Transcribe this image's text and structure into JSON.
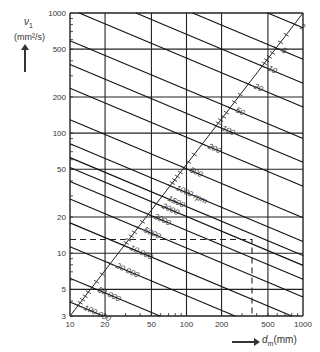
{
  "chart_data": {
    "type": "line",
    "title": "",
    "ylabel": "ν1 (mm²/s)",
    "xlabel": "dm (mm)",
    "xscale": "log",
    "yscale": "log",
    "xlim": [
      10,
      1000
    ],
    "ylim": [
      3,
      1000
    ],
    "grid": true,
    "x_ticks": [
      10,
      20,
      50,
      100,
      200,
      500,
      1000
    ],
    "x_tick_labels": [
      "10",
      "20",
      "50",
      "100",
      "200",
      "500",
      "1000"
    ],
    "y_ticks": [
      3,
      5,
      10,
      20,
      50,
      100,
      200,
      500,
      1000
    ],
    "y_tick_labels": [
      "3",
      "5",
      "10",
      "20",
      "50",
      "100",
      "200",
      "500",
      "1000"
    ],
    "rpm_scale_unit": "rpm",
    "series": [
      {
        "name": "2",
        "rpm": 2
      },
      {
        "name": "5",
        "rpm": 5
      },
      {
        "name": "10",
        "rpm": 10
      },
      {
        "name": "20",
        "rpm": 20
      },
      {
        "name": "50",
        "rpm": 50
      },
      {
        "name": "100",
        "rpm": 100
      },
      {
        "name": "200",
        "rpm": 200
      },
      {
        "name": "500",
        "rpm": 500
      },
      {
        "name": "1000 rpm",
        "rpm": 1000
      },
      {
        "name": "1500",
        "rpm": 1500
      },
      {
        "name": "2000",
        "rpm": 2000
      },
      {
        "name": "3000",
        "rpm": 3000
      },
      {
        "name": "5000",
        "rpm": 5000
      },
      {
        "name": "10 000",
        "rpm": 10000
      },
      {
        "name": "20 000",
        "rpm": 20000
      },
      {
        "name": "50 000",
        "rpm": 50000
      },
      {
        "name": "100 000",
        "rpm": 100000
      }
    ],
    "annotations": [
      {
        "type": "dashed-reference",
        "x": 365,
        "y": 13,
        "description": "example reading: dm ≈ 365 mm → ν1 ≈ 13 mm²/s"
      }
    ]
  },
  "axis": {
    "y_symbol": "ν",
    "y_sub": "1",
    "y_unit": "(mm²/s)",
    "x_symbol": "d",
    "x_sub": "m",
    "x_unit": "(mm)"
  }
}
